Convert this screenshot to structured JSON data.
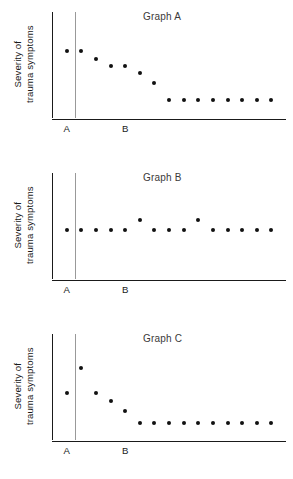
{
  "figure": {
    "y_axis_label": "Severity of\ntrauma symptoms",
    "phase_labels": {
      "baseline": "A",
      "treatment": "B"
    },
    "top_cut_text": ""
  },
  "panels": [
    {
      "id": "panel-a",
      "title": "Graph A"
    },
    {
      "id": "panel-b",
      "title": "Graph B"
    },
    {
      "id": "panel-c",
      "title": "Graph C"
    }
  ],
  "chart_data": [
    {
      "type": "scatter",
      "title": "Graph A",
      "xlabel": "",
      "ylabel": "Severity of trauma symptoms",
      "xlim": [
        0,
        16
      ],
      "ylim": [
        0,
        10
      ],
      "grid": false,
      "legend": null,
      "annotations": [
        {
          "text": "A",
          "meaning": "baseline phase",
          "x": 1
        },
        {
          "text": "B",
          "meaning": "treatment phase",
          "x": 5
        }
      ],
      "phase_change_x": 1.6,
      "description": "Baseline point high; symptoms decline steadily once treatment begins and level off low.",
      "series": [
        {
          "name": "Severity of trauma symptoms",
          "x": [
            1,
            2,
            3,
            4,
            5,
            6,
            7,
            8,
            9,
            10,
            11,
            12,
            13,
            14,
            15
          ],
          "values": [
            6.3,
            6.3,
            5.6,
            4.9,
            4.9,
            4.2,
            3.3,
            1.7,
            1.7,
            1.7,
            1.7,
            1.7,
            1.7,
            1.7,
            1.7
          ],
          "phases": [
            "A",
            "B",
            "B",
            "B",
            "B",
            "B",
            "B",
            "B",
            "B",
            "B",
            "B",
            "B",
            "B",
            "B",
            "B"
          ]
        }
      ]
    },
    {
      "type": "scatter",
      "title": "Graph B",
      "xlabel": "",
      "ylabel": "Severity of trauma symptoms",
      "xlim": [
        0,
        16
      ],
      "ylim": [
        0,
        10
      ],
      "grid": false,
      "legend": null,
      "annotations": [
        {
          "text": "A",
          "meaning": "baseline phase",
          "x": 1
        },
        {
          "text": "B",
          "meaning": "treatment phase",
          "x": 5
        }
      ],
      "phase_change_x": 1.6,
      "description": "Severity stays flat across baseline and treatment, with two slightly elevated points; no treatment effect.",
      "series": [
        {
          "name": "Severity of trauma symptoms",
          "x": [
            1,
            2,
            3,
            4,
            5,
            6,
            7,
            8,
            9,
            10,
            11,
            12,
            13,
            14,
            15
          ],
          "values": [
            4.6,
            4.6,
            4.6,
            4.6,
            4.6,
            5.6,
            4.6,
            4.6,
            4.6,
            5.6,
            4.6,
            4.6,
            4.6,
            4.6,
            4.6
          ],
          "phases": [
            "A",
            "B",
            "B",
            "B",
            "B",
            "B",
            "B",
            "B",
            "B",
            "B",
            "B",
            "B",
            "B",
            "B",
            "B"
          ]
        }
      ]
    },
    {
      "type": "scatter",
      "title": "Graph C",
      "xlabel": "",
      "ylabel": "Severity of trauma symptoms",
      "xlim": [
        0,
        16
      ],
      "ylim": [
        0,
        10
      ],
      "grid": false,
      "legend": null,
      "annotations": [
        {
          "text": "A",
          "meaning": "baseline phase",
          "x": 1
        },
        {
          "text": "B",
          "meaning": "treatment phase",
          "x": 5
        }
      ],
      "phase_change_x": 1.6,
      "description": "Severity rises sharply at the start of treatment, then drops below baseline and levels off low.",
      "series": [
        {
          "name": "Severity of trauma symptoms",
          "x": [
            1,
            2,
            3,
            4,
            5,
            6,
            7,
            8,
            9,
            10,
            11,
            12,
            13,
            14,
            15
          ],
          "values": [
            4.4,
            6.8,
            4.4,
            3.7,
            2.7,
            1.6,
            1.6,
            1.6,
            1.6,
            1.6,
            1.6,
            1.6,
            1.6,
            1.6,
            1.6
          ],
          "phases": [
            "A",
            "B",
            "B",
            "B",
            "B",
            "B",
            "B",
            "B",
            "B",
            "B",
            "B",
            "B",
            "B",
            "B",
            "B"
          ]
        }
      ]
    }
  ]
}
